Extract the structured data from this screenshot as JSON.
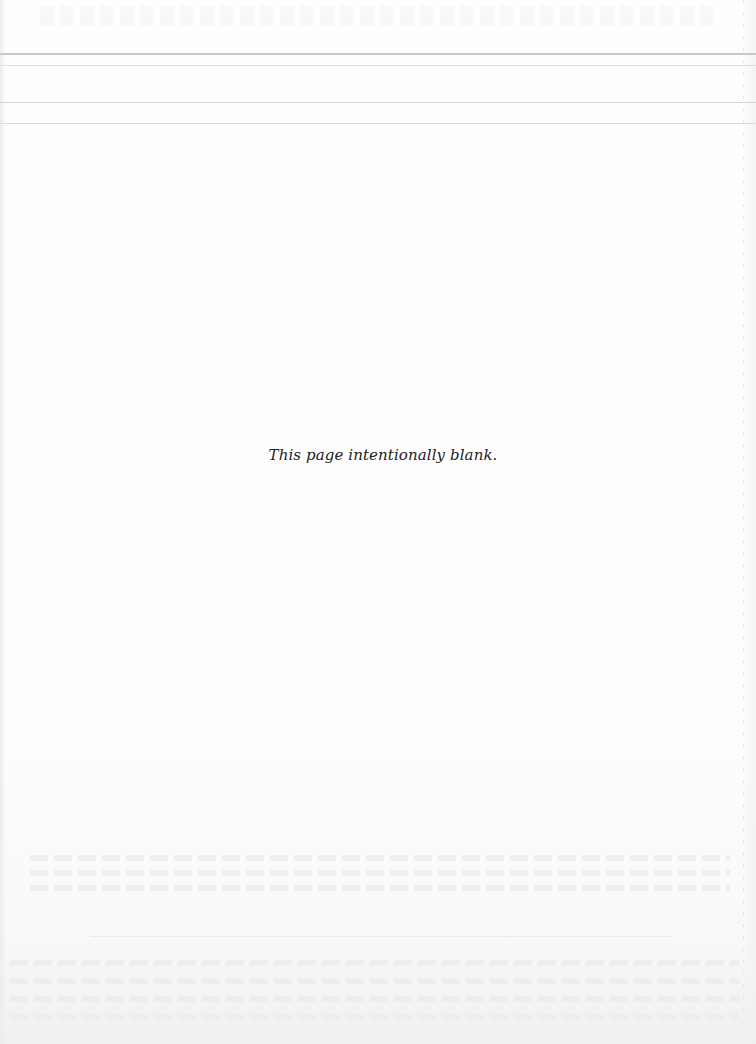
{
  "document": {
    "notice_text": "This page intentionally blank.",
    "background_color": "#fdfdfd",
    "text_color": "#222222",
    "header_rules": {
      "count": 4
    }
  }
}
